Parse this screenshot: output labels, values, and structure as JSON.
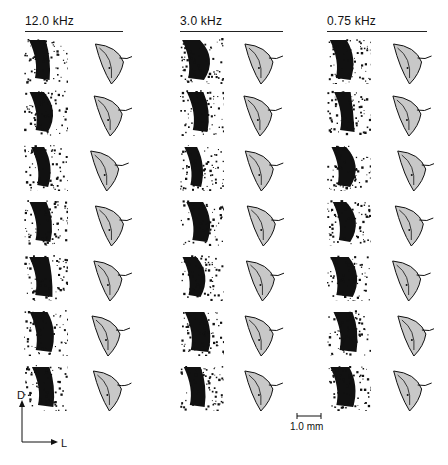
{
  "figure": {
    "columns": [
      {
        "label": "12.0 kHz",
        "x": 25,
        "rule_x": 25,
        "rule_w": 98,
        "auto_x": 24,
        "draw_x": 76
      },
      {
        "label": "3.0 kHz",
        "x": 180,
        "rule_x": 180,
        "rule_w": 103,
        "auto_x": 180,
        "draw_x": 228
      },
      {
        "label": "0.75 kHz",
        "x": 327,
        "rule_x": 327,
        "rule_w": 100,
        "auto_x": 327,
        "draw_x": 378
      }
    ],
    "rows": 7,
    "row_tops": [
      38,
      90,
      145,
      200,
      255,
      310,
      365
    ],
    "orientation_axis": {
      "dorsal_label": "D",
      "lateral_label": "L"
    },
    "scale_bar": {
      "label": "1.0 mm"
    },
    "colors": {
      "ink": "#111111",
      "shade": "#c8c8c8",
      "paper": "#ffffff"
    }
  }
}
